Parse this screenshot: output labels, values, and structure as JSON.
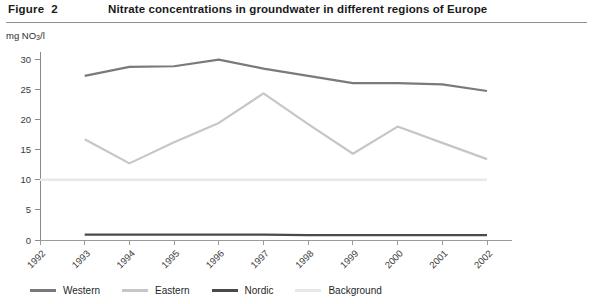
{
  "header": {
    "figure_label": "Figure  2",
    "title": "Nitrate concentrations in groundwater in different regions of Europe"
  },
  "axis": {
    "y_unit_prefix": "mg NO",
    "y_unit_sub": "3",
    "y_unit_suffix": "/l"
  },
  "legend": {
    "items": [
      {
        "label": "Western",
        "color": "#7a7a7a"
      },
      {
        "label": "Eastern",
        "color": "#c6c6c6"
      },
      {
        "label": "Nordic",
        "color": "#4a4a4a"
      },
      {
        "label": "Background",
        "color": "#e8e8e8"
      }
    ]
  },
  "chart_data": {
    "type": "line",
    "title": "Nitrate concentrations in groundwater in different regions of Europe",
    "xlabel": "",
    "ylabel": "mg NO3/l",
    "ylim": [
      0,
      30
    ],
    "yticks": [
      0,
      5,
      10,
      15,
      20,
      25,
      30
    ],
    "grid": false,
    "legend_position": "bottom",
    "categories": [
      "1992",
      "1993",
      "1994",
      "1995",
      "1996",
      "1997",
      "1998",
      "1999",
      "2000",
      "2001",
      "2002"
    ],
    "x": [
      1992,
      1993,
      1994,
      1995,
      1996,
      1997,
      1998,
      1999,
      2000,
      2001,
      2002
    ],
    "series": [
      {
        "name": "Western",
        "color": "#7a7a7a",
        "x": [
          1993,
          1994,
          1995,
          1996,
          1997,
          1998,
          1999,
          2000,
          2001,
          2002
        ],
        "values": [
          27.2,
          28.7,
          28.8,
          29.9,
          28.4,
          27.2,
          26.0,
          26.0,
          25.8,
          24.7
        ]
      },
      {
        "name": "Eastern",
        "color": "#c6c6c6",
        "x": [
          1993,
          1994,
          1995,
          1996,
          1997,
          1998,
          1999,
          2000,
          2001,
          2002
        ],
        "values": [
          16.7,
          12.7,
          16.2,
          19.4,
          24.3,
          19.2,
          14.3,
          18.8,
          16.1,
          13.4
        ]
      },
      {
        "name": "Nordic",
        "color": "#4a4a4a",
        "x": [
          1993,
          1994,
          1995,
          1996,
          1997,
          1998,
          1999,
          2000,
          2001,
          2002
        ],
        "values": [
          0.9,
          0.9,
          0.9,
          0.9,
          0.9,
          0.8,
          0.8,
          0.8,
          0.8,
          0.8
        ]
      },
      {
        "name": "Background",
        "color": "#e8e8e8",
        "x": [
          1992,
          2002
        ],
        "values": [
          10.0,
          10.0
        ]
      }
    ]
  }
}
